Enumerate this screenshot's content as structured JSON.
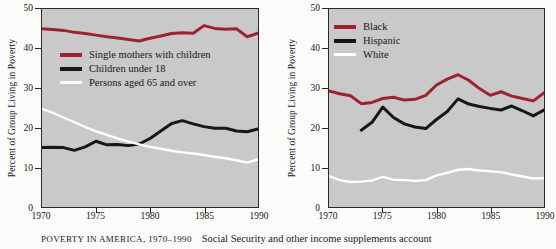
{
  "figure": {
    "caption_title": "POVERTY IN AMERICA, 1970–1990",
    "caption_body": "Social Security and other income supplements account",
    "background_color": "#c9c9c9",
    "red_color": "#9e2230",
    "black_color": "#17171a",
    "white_color": "#ffffff"
  },
  "chart_data": [
    {
      "type": "line",
      "panel": "left",
      "title": "",
      "xlabel": "",
      "ylabel": "Percent of Group Living in Poverty",
      "xlim": [
        1970,
        1990
      ],
      "ylim": [
        0,
        50
      ],
      "yticks": [
        0,
        10,
        20,
        30,
        40,
        50
      ],
      "xticks": [
        1970,
        1975,
        1980,
        1985,
        1990
      ],
      "grid": false,
      "legend_position": "upper-left-inside",
      "x": [
        1970,
        1971,
        1972,
        1973,
        1974,
        1975,
        1976,
        1977,
        1978,
        1979,
        1980,
        1981,
        1982,
        1983,
        1984,
        1985,
        1986,
        1987,
        1988,
        1989,
        1990
      ],
      "series": [
        {
          "name": "Single mothers with children",
          "color": "#9e2230",
          "values": [
            45.0,
            44.8,
            44.6,
            44.1,
            43.8,
            43.4,
            43.0,
            42.7,
            42.3,
            41.9,
            42.6,
            43.2,
            43.8,
            44.0,
            43.9,
            45.8,
            45.1,
            44.9,
            45.0,
            43.0,
            43.9
          ]
        },
        {
          "name": "Children under 18",
          "color": "#17171a",
          "values": [
            15.0,
            15.1,
            15.0,
            14.3,
            15.2,
            16.6,
            15.7,
            15.8,
            15.5,
            15.9,
            17.3,
            19.2,
            21.1,
            21.8,
            21.0,
            20.3,
            19.9,
            19.9,
            19.2,
            19.0,
            19.7
          ]
        },
        {
          "name": "Persons aged 65 and over",
          "color": "#ffffff",
          "values": [
            24.8,
            23.8,
            22.6,
            21.4,
            20.2,
            19.1,
            18.2,
            17.3,
            16.5,
            15.8,
            15.2,
            14.7,
            14.2,
            13.8,
            13.5,
            13.1,
            12.7,
            12.3,
            11.8,
            11.2,
            12.0
          ]
        }
      ]
    },
    {
      "type": "line",
      "panel": "right",
      "title": "",
      "xlabel": "",
      "ylabel": "Percent of Group Living in Poverty",
      "xlim": [
        1970,
        1990
      ],
      "ylim": [
        0,
        50
      ],
      "yticks": [
        0,
        10,
        20,
        30,
        40,
        50
      ],
      "xticks": [
        1970,
        1975,
        1980,
        1985,
        1990
      ],
      "grid": false,
      "legend_position": "upper-left-inside",
      "x": [
        1970,
        1971,
        1972,
        1973,
        1974,
        1975,
        1976,
        1977,
        1978,
        1979,
        1980,
        1981,
        1982,
        1983,
        1984,
        1985,
        1986,
        1987,
        1988,
        1989,
        1990
      ],
      "series": [
        {
          "name": "Black",
          "color": "#9e2230",
          "values": [
            29.3,
            28.6,
            28.1,
            26.1,
            26.4,
            27.4,
            27.7,
            27.0,
            27.2,
            28.2,
            30.8,
            32.3,
            33.4,
            32.0,
            29.9,
            28.2,
            29.1,
            28.0,
            27.4,
            26.8,
            28.8
          ]
        },
        {
          "name": "Hispanic",
          "color": "#17171a",
          "values": [
            null,
            null,
            null,
            19.4,
            21.4,
            25.2,
            22.6,
            21.0,
            20.2,
            19.8,
            22.1,
            24.1,
            27.3,
            26.0,
            25.4,
            24.9,
            24.5,
            25.5,
            24.3,
            23.0,
            24.5
          ]
        },
        {
          "name": "White",
          "color": "#ffffff",
          "values": [
            7.8,
            6.8,
            6.3,
            6.4,
            6.7,
            7.6,
            6.9,
            6.8,
            6.6,
            6.8,
            8.0,
            8.6,
            9.4,
            9.6,
            9.2,
            9.0,
            8.8,
            8.2,
            7.7,
            7.2,
            7.3
          ]
        }
      ]
    }
  ],
  "left_panel": {
    "yticks": [
      "0",
      "10",
      "20",
      "30",
      "40",
      "50"
    ],
    "xticks": [
      "1970",
      "1975",
      "1980",
      "1985",
      "1990"
    ],
    "axis_title": "Percent of Group Living in Poverty",
    "legend": [
      {
        "label": "Single mothers with children",
        "color": "#9e2230",
        "weight": "thick"
      },
      {
        "label": "Children under 18",
        "color": "#17171a",
        "weight": "thick"
      },
      {
        "label": "Persons aged 65 and over",
        "color": "#ffffff",
        "weight": "thin"
      }
    ]
  },
  "right_panel": {
    "yticks": [
      "0",
      "10",
      "20",
      "30",
      "40",
      "50"
    ],
    "xticks": [
      "1970",
      "1975",
      "1980",
      "1985",
      "1990"
    ],
    "axis_title": "Percent of Group Living in Poverty",
    "legend": [
      {
        "label": "Black",
        "color": "#9e2230",
        "weight": "thick"
      },
      {
        "label": "Hispanic",
        "color": "#17171a",
        "weight": "thick"
      },
      {
        "label": "White",
        "color": "#ffffff",
        "weight": "thin"
      }
    ]
  }
}
